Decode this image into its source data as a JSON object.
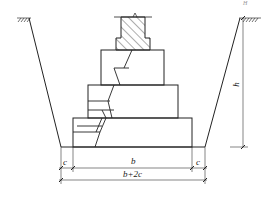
{
  "diagram": {
    "type": "stepped brick foundation in trench cross-section",
    "labels": {
      "height": "h",
      "width_base": "b",
      "clearance_left": "c",
      "clearance_right": "c",
      "trench_bottom_width": "b+2c",
      "corner_mark": "H"
    },
    "colors": {
      "line": "#222222",
      "hatch": "#333333",
      "background": "#ffffff"
    }
  }
}
